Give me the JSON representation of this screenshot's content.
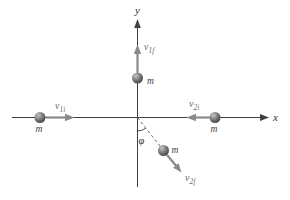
{
  "diagram": {
    "kind": "two-particle-collision-figure"
  },
  "labels": {
    "x_axis": "x",
    "y_axis": "y",
    "mass": "m",
    "angle": "φ",
    "v1i": {
      "base": "v",
      "sub": "1i"
    },
    "v2i": {
      "base": "v",
      "sub": "2i"
    },
    "v1f": {
      "base": "v",
      "sub": "1f"
    },
    "v2f": {
      "base": "v",
      "sub": "2f"
    }
  },
  "colors": {
    "background": "#ffffff",
    "axis": "#3f3f3f",
    "vector": "#8a8a8a",
    "dashed_line": "#5a5a5a",
    "axis_text": "#2f2f2f",
    "vector_label_text": "#6b6b6b",
    "mass_label_text": "#3f3f3f",
    "ball_highlight": "#c6c6c6",
    "ball_mid": "#6e6e6e",
    "ball_dark": "#383838"
  }
}
